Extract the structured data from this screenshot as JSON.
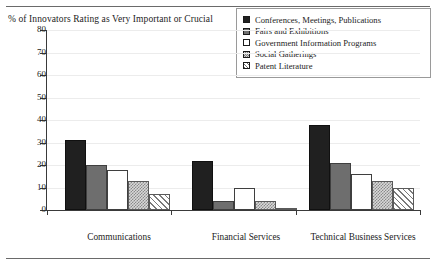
{
  "chart_data": {
    "type": "bar",
    "title": "% of Innovators Rating as Very Important or Crucial",
    "xlabel": "",
    "ylabel": "",
    "ylim": [
      0,
      80
    ],
    "ytick_values": [
      0,
      10,
      20,
      30,
      40,
      50,
      60,
      70,
      80
    ],
    "ytick_labels": [
      "0",
      "10",
      "20",
      "30",
      "40",
      "50",
      "60",
      "70",
      "80"
    ],
    "grid": true,
    "legend_position": "top-right",
    "categories": [
      "Communications",
      "Financial Services",
      "Technical Business Services"
    ],
    "series": [
      {
        "name": "Conferences, Meetings, Publications",
        "swatch": "solid-black",
        "color": "#202020",
        "values": [
          31,
          22,
          38
        ]
      },
      {
        "name": "Fairs and Exhibitions",
        "swatch": "gray",
        "color": "#6e6e6e",
        "values": [
          20,
          4,
          21
        ]
      },
      {
        "name": "Government Information Programs",
        "swatch": "white",
        "color": "#ffffff",
        "values": [
          18,
          10,
          16
        ]
      },
      {
        "name": "Social Gatherings",
        "swatch": "dots",
        "color": "#d8d8d8",
        "values": [
          13,
          4,
          13
        ]
      },
      {
        "name": "Patent Literature",
        "swatch": "hatch",
        "color": "#ffffff",
        "values": [
          7,
          1,
          10
        ]
      }
    ]
  }
}
